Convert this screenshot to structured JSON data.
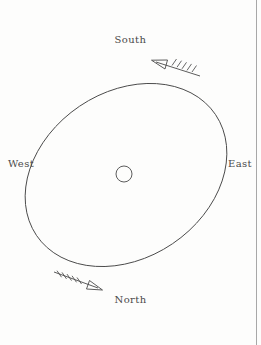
{
  "figure": {
    "background_color": "#fdfdfc",
    "stroke_color": "#4a4a4a",
    "width": 261,
    "height": 345
  },
  "labels": {
    "south": "South",
    "north": "North",
    "west": "West",
    "east": "East"
  },
  "shapes": {
    "ellipse": {
      "name": "tilted-ellipse",
      "center_x": 126,
      "center_y": 175,
      "radius_x": 108,
      "radius_y": 83,
      "rotation_deg": -34
    },
    "center_circle": {
      "name": "center-circle",
      "center_x": 124,
      "center_y": 174,
      "radius": 8
    },
    "right_rule": {
      "name": "right-edge-rule",
      "x": 256,
      "y1": 0,
      "y2": 345
    }
  },
  "arrows": [
    {
      "name": "rotation-arrow-upper-right",
      "tip_x": 152,
      "tip_y": 60,
      "tail_x": 200,
      "tail_y": 75,
      "barbs": 5,
      "direction": "up-left"
    },
    {
      "name": "rotation-arrow-lower-left",
      "tip_x": 101,
      "tip_y": 290,
      "tail_x": 54,
      "tail_y": 272,
      "barbs": 5,
      "direction": "down-right"
    }
  ]
}
